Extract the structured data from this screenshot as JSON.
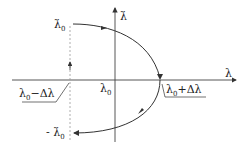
{
  "diagram": {
    "axes": {
      "x_label": "λ",
      "y_label": "λ̇"
    },
    "labels": {
      "top_start": "λ̇",
      "top_start_sub": "0",
      "bottom_end_prefix": "- ",
      "bottom_end": "λ̇",
      "bottom_end_sub": "0",
      "origin": "λ",
      "origin_sub": "0",
      "left_point": "λ",
      "left_point_sub": "0",
      "left_point_suffix": "−Δλ",
      "right_point": "λ",
      "right_point_sub": "0",
      "right_point_suffix": "+Δλ"
    },
    "colors": {
      "line": "#333333",
      "axis": "#444444",
      "dashed": "#999999"
    }
  }
}
